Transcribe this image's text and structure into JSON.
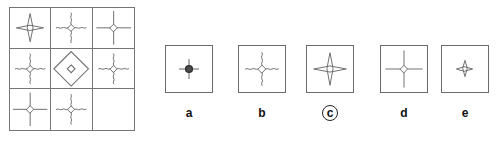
{
  "puzzle": {
    "type": "visual-analogy-matrix",
    "matrix": {
      "name": "3x3-matrix",
      "rows": 3,
      "cols": 3,
      "cells": [
        {
          "id": "r1c1",
          "figure": "star-diamond-straight-arms",
          "center": "diamond-outline",
          "arms": "straight",
          "arm_length": "medium",
          "description": "Four-pointed star: small open diamond with four straight arms"
        },
        {
          "id": "r1c2",
          "figure": "star-diamond-wavy-arms",
          "center": "diamond-outline",
          "arms": "wavy",
          "arm_length": "medium",
          "description": "Small open diamond with four wavy (squiggly) arms"
        },
        {
          "id": "r1c3",
          "figure": "star-diamond-straight-arms",
          "center": "diamond-outline",
          "arms": "straight",
          "arm_length": "long",
          "description": "Small open diamond with four long straight arms"
        },
        {
          "id": "r2c1",
          "figure": "star-diamond-wavy-arms",
          "center": "diamond-outline",
          "arms": "wavy",
          "arm_length": "medium",
          "description": "Small open diamond with four wavy arms"
        },
        {
          "id": "r2c2",
          "figure": "large-diamond-with-inner-diamond",
          "center": "diamond-outline",
          "arms": "none",
          "arm_length": "none",
          "description": "Large diamond outline containing a small diamond at its center"
        },
        {
          "id": "r2c3",
          "figure": "star-diamond-wavy-arms",
          "center": "diamond-outline",
          "arms": "wavy",
          "arm_length": "medium",
          "description": "Small open diamond with four wavy arms"
        },
        {
          "id": "r3c1",
          "figure": "star-diamond-straight-arms",
          "center": "diamond-outline",
          "arms": "straight",
          "arm_length": "long",
          "description": "Small open diamond with four long straight arms"
        },
        {
          "id": "r3c2",
          "figure": "star-diamond-wavy-arms",
          "center": "diamond-outline",
          "arms": "wavy",
          "arm_length": "medium",
          "description": "Small open diamond with four wavy arms"
        },
        {
          "id": "r3c3",
          "figure": "empty",
          "center": "none",
          "arms": "none",
          "arm_length": "none",
          "description": "Empty cell — the missing piece to be solved"
        }
      ]
    },
    "options": [
      {
        "label": "a",
        "figure": "star-filled-circle-straight-arms",
        "center": "filled-circle",
        "arms": "straight",
        "arm_length": "medium",
        "selected": false,
        "description": "Dark filled circle centre with four short straight arms"
      },
      {
        "label": "b",
        "figure": "star-diamond-wavy-arms",
        "center": "diamond-outline",
        "arms": "wavy",
        "arm_length": "medium",
        "selected": false,
        "description": "Small open diamond with four wavy arms"
      },
      {
        "label": "c",
        "figure": "star-diamond-straight-arms",
        "center": "diamond-outline",
        "arms": "straight",
        "arm_length": "medium",
        "selected": true,
        "description": "Small open diamond with four straight tapered arms"
      },
      {
        "label": "d",
        "figure": "star-diamond-straight-arms-long",
        "center": "diamond-outline",
        "arms": "straight",
        "arm_length": "long",
        "selected": false,
        "description": "Small open diamond with four long straight arms reaching the box edges"
      },
      {
        "label": "e",
        "figure": "small-star-diamond",
        "center": "diamond-outline",
        "arms": "straight",
        "arm_length": "short",
        "selected": false,
        "description": "Small open diamond with four very short arms"
      }
    ],
    "answer": "c"
  },
  "colors": {
    "stroke": "#6b6b6b",
    "grid_line": "#767676",
    "label_text": "#111111",
    "background": "#ffffff",
    "filled_center": "#444444"
  }
}
